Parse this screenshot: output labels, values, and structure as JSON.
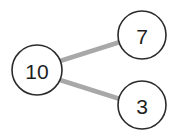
{
  "diagram": {
    "kind": "number-bond",
    "background_color": "#ffffff",
    "whole": {
      "label": "10",
      "cx": 37,
      "cy": 70,
      "r": 25
    },
    "parts": [
      {
        "name": "part-top",
        "label": "7",
        "cx": 142,
        "cy": 35,
        "r": 24
      },
      {
        "name": "part-bottom",
        "label": "3",
        "cx": 142,
        "cy": 105,
        "r": 24
      }
    ],
    "edges": [
      {
        "name": "edge-whole-to-part-top",
        "x1": 60,
        "y1": 61,
        "x2": 120,
        "y2": 42,
        "color": "#a8a8a8"
      },
      {
        "name": "edge-whole-to-part-bottom",
        "x1": 60,
        "y1": 80,
        "x2": 120,
        "y2": 99,
        "color": "#a8a8a8"
      }
    ],
    "node_stroke_color": "#2b2b2b",
    "node_fill_color": "#ffffff",
    "label_color": "#1e1e1e"
  }
}
